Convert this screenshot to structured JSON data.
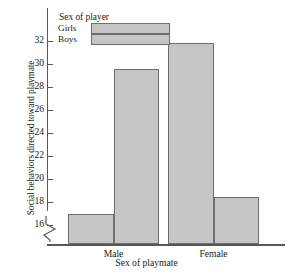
{
  "chart_data": {
    "type": "bar",
    "title": "",
    "subtitle": "",
    "xlabel": "Sex of playmate",
    "ylabel": "Social behaviors directed toward playmate",
    "categories": [
      "Male",
      "Female"
    ],
    "series": [
      {
        "name": "Girls",
        "values": [
          17.0,
          31.8
        ]
      },
      {
        "name": "Boys",
        "values": [
          29.6,
          18.4
        ]
      }
    ],
    "ylim": [
      16,
      32
    ],
    "y_axis_break": true,
    "y_ticks": [
      16,
      18,
      20,
      22,
      24,
      26,
      28,
      30,
      32
    ],
    "y_tick_labels": [
      "16",
      "18",
      "20",
      "22",
      "24",
      "26",
      "28",
      "30",
      "32"
    ],
    "grid": false,
    "legend": {
      "title": "Sex of player",
      "position": "top-left-inside",
      "entries": [
        "Girls",
        "Boys"
      ]
    },
    "colors": {
      "bar_fill": "#c6c6c6",
      "bar_edge": "#6d6d6d",
      "axis": "#585858",
      "text": "#1a1a1a",
      "background": "#ffffff"
    }
  }
}
